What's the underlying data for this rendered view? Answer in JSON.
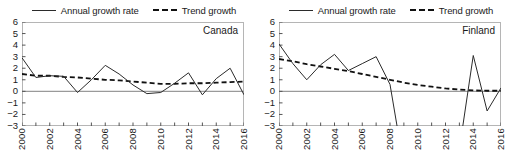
{
  "legend": {
    "entries": [
      {
        "label": "Annual growth rate",
        "style": "solid",
        "color": "#2b2b2b",
        "key_name": "legend-key-annual-growth-rate"
      },
      {
        "label": "Trend growth",
        "style": "dashed",
        "color": "#111111",
        "key_name": "legend-key-trend-growth"
      }
    ]
  },
  "axis": {
    "y_ticks": [
      "6",
      "5",
      "4",
      "3",
      "2",
      "1",
      "0",
      "−1",
      "−2",
      "−3"
    ],
    "x_ticks": [
      "2000",
      "2002",
      "2004",
      "2006",
      "2008",
      "2010",
      "2012",
      "2014",
      "2016"
    ]
  },
  "colors": {
    "series_line": "#2b2b2b",
    "trend_line": "#111111",
    "zero_line": "#9a9a9a",
    "frame": "#b5b5b5",
    "tick": "#555555",
    "text": "#1a1a1a"
  },
  "chart_data": [
    {
      "type": "line",
      "title": "Canada",
      "xlabel": "",
      "ylabel": "",
      "xlim": [
        2000,
        2016
      ],
      "ylim": [
        -3,
        6
      ],
      "grid": false,
      "legend_position": "top-center-shared",
      "y_ticks": [
        -3,
        -2,
        -1,
        0,
        1,
        2,
        3,
        4,
        5,
        6
      ],
      "x_ticks": [
        2000,
        2002,
        2004,
        2006,
        2008,
        2010,
        2012,
        2014,
        2016
      ],
      "zero_line": 0,
      "series": [
        {
          "name": "Annual growth rate",
          "style": "solid",
          "x": [
            2000,
            2001,
            2002,
            2003,
            2004,
            2005,
            2006,
            2007,
            2008,
            2009,
            2010,
            2011,
            2012,
            2013,
            2014,
            2015,
            2016
          ],
          "values": [
            2.9,
            1.2,
            1.35,
            1.3,
            -0.1,
            1.0,
            2.25,
            1.5,
            0.55,
            -0.2,
            -0.1,
            0.7,
            1.6,
            -0.3,
            1.1,
            2.0,
            -0.3
          ]
        },
        {
          "name": "Trend growth",
          "style": "dashed",
          "x": [
            2000,
            2001,
            2002,
            2003,
            2004,
            2005,
            2006,
            2007,
            2008,
            2009,
            2010,
            2011,
            2012,
            2013,
            2014,
            2015,
            2016
          ],
          "values": [
            1.5,
            1.35,
            1.35,
            1.25,
            1.2,
            1.1,
            1.0,
            0.95,
            0.85,
            0.75,
            0.65,
            0.65,
            0.7,
            0.7,
            0.75,
            0.8,
            0.85
          ]
        }
      ]
    },
    {
      "type": "line",
      "title": "Finland",
      "xlabel": "",
      "ylabel": "",
      "xlim": [
        2000,
        2016
      ],
      "ylim": [
        -3,
        6
      ],
      "grid": false,
      "legend_position": "top-center-shared",
      "y_ticks": [
        -3,
        -2,
        -1,
        0,
        1,
        2,
        3,
        4,
        5,
        6
      ],
      "x_ticks": [
        2000,
        2002,
        2004,
        2006,
        2008,
        2010,
        2012,
        2014,
        2016
      ],
      "zero_line": 0,
      "note": "Series falls below the plotted y-range between 2009 and 2013 and is clipped at -3.",
      "series": [
        {
          "name": "Annual growth rate",
          "style": "solid",
          "x": [
            2000,
            2001,
            2002,
            2003,
            2004,
            2005,
            2006,
            2007,
            2008,
            2009,
            2013,
            2014,
            2015,
            2016
          ],
          "values": [
            4.1,
            2.4,
            1.0,
            2.3,
            3.2,
            1.8,
            2.4,
            3.0,
            0.6,
            -6.5,
            -5.0,
            3.1,
            -1.7,
            0.3
          ]
        },
        {
          "name": "Trend growth",
          "style": "dashed",
          "x": [
            2000,
            2001,
            2002,
            2003,
            2004,
            2005,
            2006,
            2007,
            2008,
            2009,
            2010,
            2011,
            2012,
            2013,
            2014,
            2015,
            2016
          ],
          "values": [
            2.8,
            2.6,
            2.35,
            2.15,
            1.95,
            1.75,
            1.5,
            1.25,
            1.0,
            0.75,
            0.55,
            0.4,
            0.25,
            0.15,
            0.08,
            0.05,
            0.05
          ]
        }
      ]
    }
  ]
}
